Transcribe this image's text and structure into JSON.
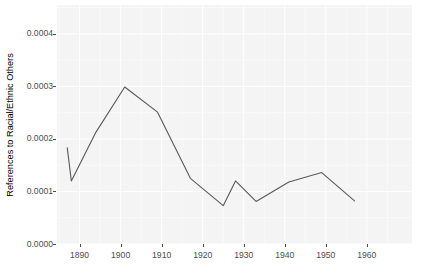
{
  "chart_data": {
    "type": "line",
    "title": "",
    "xlabel": "",
    "ylabel": "References to Racial/Ethnic Others",
    "xlim": [
      1884.5,
      1971.0
    ],
    "ylim": [
      0.0,
      0.000455
    ],
    "x_ticks": [
      1890,
      1900,
      1910,
      1920,
      1930,
      1940,
      1950,
      1960
    ],
    "x_tick_labels": [
      "1890",
      "1900",
      "1910",
      "1920",
      "1930",
      "1940",
      "1950",
      "1960"
    ],
    "y_ticks": [
      0.0,
      0.0001,
      0.0002,
      0.0003,
      0.0004
    ],
    "y_tick_labels": [
      "0.0000",
      "0.0001",
      "0.0002",
      "0.0003",
      "0.0004"
    ],
    "grid": true,
    "grid_color": "#ffffff",
    "panel_background": "#f4f4f4",
    "legend": null,
    "series": [
      {
        "name": "References to Racial/Ethnic Others",
        "color": "#595959",
        "line_width": 1.1,
        "x": [
          1887,
          1888,
          1894,
          1901,
          1909,
          1917,
          1925,
          1928,
          1933,
          1941,
          1949,
          1957
        ],
        "values": [
          0.000183,
          0.00012,
          0.000213,
          0.000299,
          0.000251,
          0.000125,
          7.3e-05,
          0.00012,
          8.1e-05,
          0.000118,
          0.000136,
          8.2e-05
        ]
      }
    ]
  },
  "axis": {
    "y_title": "References to Racial/Ethnic Others",
    "tick_color": "#4d4d4d"
  }
}
